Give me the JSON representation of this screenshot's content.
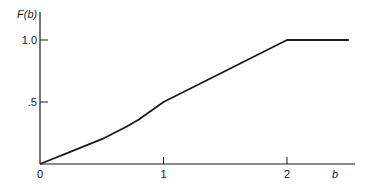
{
  "chart_data": {
    "type": "line",
    "title": "",
    "xlabel": "b",
    "ylabel": "F(b)",
    "xlim": [
      0,
      2.55
    ],
    "ylim": [
      0,
      1.22
    ],
    "grid": false,
    "legend": "none",
    "x_ticks": [
      {
        "value": 0,
        "label": "0"
      },
      {
        "value": 1,
        "label": "1"
      },
      {
        "value": 2,
        "label": "2"
      }
    ],
    "y_ticks": [
      {
        "value": 0.5,
        "label": ".5"
      },
      {
        "value": 1.0,
        "label": "1.0"
      }
    ],
    "series": [
      {
        "name": "F(b)",
        "x": [
          0,
          0.1,
          0.2,
          0.3,
          0.4,
          0.5,
          0.6,
          0.7,
          0.8,
          0.9,
          1.0,
          1.25,
          1.5,
          1.75,
          2.0,
          2.25,
          2.5
        ],
        "y": [
          0,
          0.04,
          0.08,
          0.12,
          0.16,
          0.2,
          0.25,
          0.3,
          0.36,
          0.43,
          0.5,
          0.625,
          0.75,
          0.875,
          1.0,
          1.0,
          1.0
        ]
      }
    ]
  }
}
